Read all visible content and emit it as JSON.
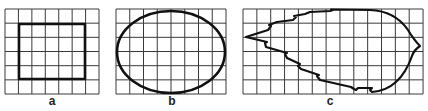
{
  "panels": [
    {
      "id": "a",
      "label": "a",
      "shape": "square",
      "grid": {
        "x": 5,
        "y": 9,
        "cols": 7,
        "rows": 6,
        "cw": 13.43,
        "ch": 14.17
      },
      "outline": {
        "x": 19,
        "y": 24,
        "w": 66,
        "h": 55
      },
      "label_pos": {
        "x": 52,
        "y": 105
      }
    },
    {
      "id": "b",
      "label": "b",
      "shape": "ellipse",
      "grid": {
        "x": 116,
        "y": 9,
        "cols": 8,
        "rows": 6,
        "cw": 13.75,
        "ch": 14.17
      },
      "outline": {
        "cx": 171,
        "cy": 52,
        "rx": 54,
        "ry": 41
      },
      "label_pos": {
        "x": 172,
        "y": 105
      }
    },
    {
      "id": "c",
      "label": "c",
      "shape": "leaf",
      "grid": {
        "x": 243,
        "y": 9,
        "cols": 13,
        "rows": 6,
        "cw": 13.85,
        "ch": 14.17
      },
      "outline_path": "M 246 37 L 268 30 L 271 26 L 269 25 L 277 22 L 293 20 L 296 17 L 294 16 L 305 14 L 310 12 L 330 11 L 333 10 L 331 9.5 L 370 10 Q 395 11 408 30 Q 414 40 420 46 Q 414 50 412 56 Q 400 90 372 92 L 370 90 L 372 88 L 358 88 L 356 90 L 354 89 L 351 87 L 320 80 L 317 76 L 319 75 L 301 69 L 298 66 L 300 64 L 287 58 L 285 54 L 287 53 L 266 47 L 265 43 L 267 42 Z",
      "label_pos": {
        "x": 330,
        "y": 105
      }
    }
  ],
  "colors": {
    "grid": "#3a3a3a",
    "outline": "#111111"
  }
}
